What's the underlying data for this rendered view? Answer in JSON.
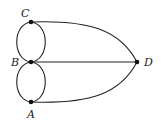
{
  "diagram": {
    "type": "multigraph",
    "nodes": [
      {
        "id": "C",
        "label": "C",
        "x": 31,
        "y": 22
      },
      {
        "id": "B",
        "label": "B",
        "x": 31,
        "y": 62
      },
      {
        "id": "A",
        "label": "A",
        "x": 31,
        "y": 102
      },
      {
        "id": "D",
        "label": "D",
        "x": 137,
        "y": 62
      }
    ],
    "edges": [
      {
        "from": "C",
        "to": "B",
        "kind": "left-arc"
      },
      {
        "from": "C",
        "to": "B",
        "kind": "right-arc"
      },
      {
        "from": "B",
        "to": "A",
        "kind": "left-arc"
      },
      {
        "from": "B",
        "to": "A",
        "kind": "right-arc"
      },
      {
        "from": "C",
        "to": "D",
        "kind": "curve"
      },
      {
        "from": "B",
        "to": "D",
        "kind": "straight"
      },
      {
        "from": "A",
        "to": "D",
        "kind": "curve"
      }
    ],
    "colors": {
      "stroke": "#222222",
      "node": "#111111",
      "label": "#222222"
    }
  }
}
